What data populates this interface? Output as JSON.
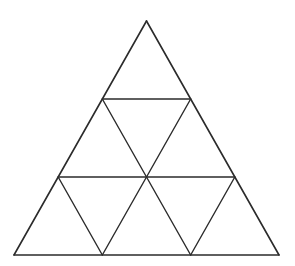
{
  "figure": {
    "name": "subdivided-equilateral-triangle",
    "title": "Equilateral triangle subdivided into 16 congruent small triangles",
    "background_color": "#ffffff",
    "line_color": "#2b2b2b",
    "line_width": 1.4,
    "canvas": {
      "width": 295,
      "height": 266
    },
    "subdivisions": 4,
    "small_triangle_count": 16,
    "upward_triangle_count": 10,
    "downward_triangle_count": 6,
    "row_triangle_counts": [
      1,
      3,
      5,
      7
    ],
    "apex": {
      "x": 146.5,
      "y": 21
    },
    "base_left": {
      "x": 14,
      "y": 255
    },
    "base_right": {
      "x": 279,
      "y": 255
    },
    "row_y": [
      21,
      99,
      177,
      255
    ],
    "rows": [
      {
        "index": 0,
        "y": 21,
        "x_left": 146.5,
        "x_right": 146.5,
        "vertex_count": 1,
        "triangles": 1
      },
      {
        "index": 1,
        "y": 99,
        "x_left": 102.33,
        "x_right": 190.67,
        "vertex_count": 2,
        "triangles": 3
      },
      {
        "index": 2,
        "y": 177,
        "x_left": 58.17,
        "x_right": 234.83,
        "vertex_count": 3,
        "triangles": 5
      },
      {
        "index": 3,
        "y": 255,
        "x_left": 14,
        "x_right": 279,
        "vertex_count": 4,
        "triangles": 7
      }
    ],
    "horizontal_lines": [
      {
        "name": "row-1-line",
        "y": 99,
        "x1": 102.33,
        "x2": 190.67
      },
      {
        "name": "row-2-line",
        "y": 177,
        "x1": 58.17,
        "x2": 234.83
      },
      {
        "name": "base-line",
        "y": 255,
        "x1": 14,
        "x2": 279
      }
    ],
    "left_leaning_lines": [
      {
        "name": "outer-left-edge",
        "x1": 146.5,
        "y1": 21,
        "x2": 14,
        "y2": 255
      },
      {
        "name": "inner-left-1",
        "x1": 190.67,
        "y1": 99,
        "x2": 102.33,
        "y2": 255
      },
      {
        "name": "inner-left-2",
        "x1": 234.83,
        "y1": 177,
        "x2": 190.67,
        "y2": 255
      }
    ],
    "right_leaning_lines": [
      {
        "name": "outer-right-edge",
        "x1": 146.5,
        "y1": 21,
        "x2": 279,
        "y2": 255
      },
      {
        "name": "inner-right-1",
        "x1": 102.33,
        "y1": 99,
        "x2": 190.67,
        "y2": 255
      },
      {
        "name": "inner-right-2",
        "x1": 58.17,
        "y1": 177,
        "x2": 102.33,
        "y2": 255
      }
    ]
  }
}
